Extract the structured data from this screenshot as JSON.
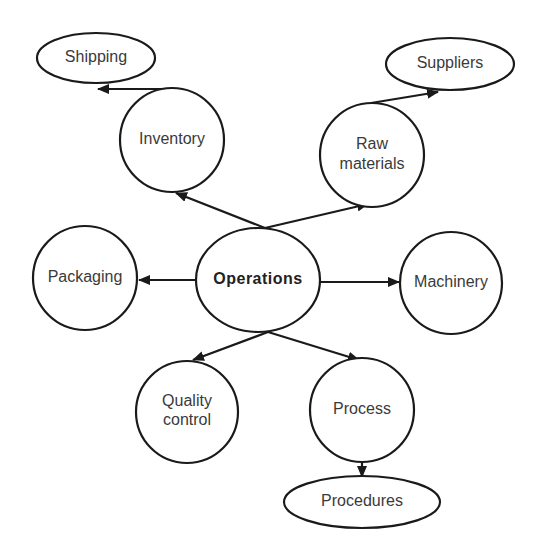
{
  "diagram": {
    "type": "mind-map",
    "central": "Operations",
    "nodes": {
      "operations": {
        "label": "Operations",
        "shape": "ellipse"
      },
      "inventory": {
        "label": "Inventory",
        "shape": "circle"
      },
      "raw_materials": {
        "line1": "Raw",
        "line2": "materials",
        "shape": "circle"
      },
      "packaging": {
        "label": "Packaging",
        "shape": "circle"
      },
      "machinery": {
        "label": "Machinery",
        "shape": "circle"
      },
      "quality_control": {
        "line1": "Quality",
        "line2": "control",
        "shape": "circle"
      },
      "process": {
        "label": "Process",
        "shape": "circle"
      },
      "shipping": {
        "label": "Shipping",
        "shape": "ellipse"
      },
      "suppliers": {
        "label": "Suppliers",
        "shape": "ellipse"
      },
      "procedures": {
        "label": "Procedures",
        "shape": "ellipse"
      }
    },
    "edges": [
      {
        "from": "Operations",
        "to": "Inventory"
      },
      {
        "from": "Operations",
        "to": "Raw materials"
      },
      {
        "from": "Operations",
        "to": "Packaging"
      },
      {
        "from": "Operations",
        "to": "Machinery"
      },
      {
        "from": "Operations",
        "to": "Quality control"
      },
      {
        "from": "Operations",
        "to": "Process"
      },
      {
        "from": "Inventory",
        "to": "Shipping"
      },
      {
        "from": "Raw materials",
        "to": "Suppliers"
      },
      {
        "from": "Process",
        "to": "Procedures"
      }
    ],
    "colors": {
      "stroke": "#1a1a1a",
      "text": "#3a3a3a",
      "background": "#ffffff"
    }
  }
}
